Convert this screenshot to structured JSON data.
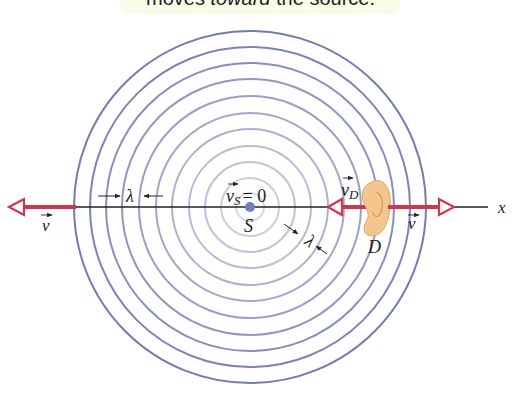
{
  "caption": {
    "prefix": "moves ",
    "emphasis": "toward",
    "suffix": " the source."
  },
  "labels": {
    "source_velocity": "v",
    "source_velocity_sub": "S",
    "source_velocity_eq": "= 0",
    "source": "S",
    "detector": "D",
    "detector_velocity": "v",
    "detector_velocity_sub": "D",
    "wave_velocity_left": "v",
    "wave_velocity_right": "v",
    "wavelength_left": "λ",
    "wavelength_diag": "λ",
    "axis": "x"
  },
  "waves": {
    "center": [
      250,
      207
    ],
    "radii": [
      14,
      29,
      45,
      61,
      78,
      94,
      111,
      128,
      144,
      160,
      176
    ],
    "color": "#6a76a8"
  },
  "colors": {
    "arrow": "#d2354f",
    "axis": "#222222",
    "source_dot": "#6e7fc0",
    "ear": "#f3c690"
  }
}
